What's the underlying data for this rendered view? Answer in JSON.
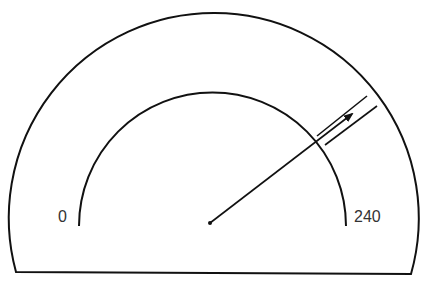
{
  "gauge": {
    "min_label": "0",
    "max_label": "240",
    "min_value": 0,
    "max_value": 240,
    "stroke_color": "#111111",
    "label_color": "#333333"
  }
}
